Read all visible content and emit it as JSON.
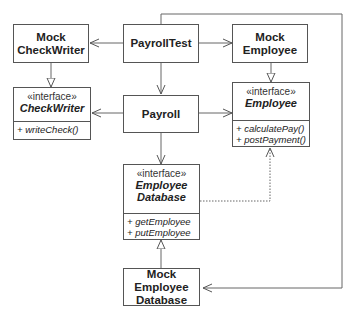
{
  "diagram": {
    "classes": {
      "payroll_test": {
        "name": "PayrollTest"
      },
      "mock_check_writer": {
        "name_line1": "Mock",
        "name_line2": "CheckWriter"
      },
      "mock_employee": {
        "name_line1": "Mock",
        "name_line2": "Employee"
      },
      "check_writer": {
        "stereotype": "«interface»",
        "name": "CheckWriter",
        "operations": [
          "+ writeCheck()"
        ]
      },
      "payroll": {
        "name": "Payroll"
      },
      "employee": {
        "stereotype": "«interface»",
        "name": "Employee",
        "operations": [
          "+ calculatePay()",
          "+ postPayment()"
        ]
      },
      "employee_database": {
        "stereotype": "«interface»",
        "name_line1": "Employee",
        "name_line2": "Database",
        "operations": [
          "+ getEmployee",
          "+ putEmployee"
        ]
      },
      "mock_employee_database": {
        "name_line1": "Mock",
        "name_line2": "Employee",
        "name_line3": "Database"
      }
    },
    "relationships": [
      {
        "from": "PayrollTest",
        "to": "MockCheckWriter",
        "type": "association"
      },
      {
        "from": "PayrollTest",
        "to": "MockEmployee",
        "type": "association"
      },
      {
        "from": "PayrollTest",
        "to": "Payroll",
        "type": "association"
      },
      {
        "from": "PayrollTest",
        "to": "MockEmployeeDatabase",
        "type": "association"
      },
      {
        "from": "MockCheckWriter",
        "to": "CheckWriter",
        "type": "realization"
      },
      {
        "from": "MockEmployee",
        "to": "Employee",
        "type": "realization"
      },
      {
        "from": "Payroll",
        "to": "CheckWriter",
        "type": "association"
      },
      {
        "from": "Payroll",
        "to": "Employee",
        "type": "association"
      },
      {
        "from": "Payroll",
        "to": "EmployeeDatabase",
        "type": "association"
      },
      {
        "from": "MockEmployeeDatabase",
        "to": "EmployeeDatabase",
        "type": "realization"
      },
      {
        "from": "EmployeeDatabase",
        "to": "Employee",
        "type": "dependency"
      }
    ]
  }
}
